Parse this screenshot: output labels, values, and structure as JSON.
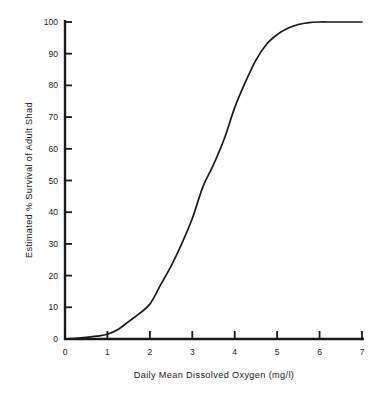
{
  "chart_data": {
    "type": "line",
    "title": "",
    "subtitle": "",
    "xlabel": "Daily Mean Dissolved Oxygen (mg/l)",
    "ylabel": "Estimated % Survival of Adult Shad",
    "xlim": [
      0,
      7
    ],
    "ylim": [
      0,
      100
    ],
    "grid": false,
    "legend": null,
    "xticks": [
      "0",
      "1",
      "2",
      "3",
      "4",
      "5",
      "6",
      "7"
    ],
    "xtick_values": [
      0,
      1,
      2,
      3,
      4,
      5,
      6,
      7
    ],
    "yticks": [
      "0",
      "10",
      "20",
      "30",
      "40",
      "50",
      "60",
      "70",
      "80",
      "90",
      "100"
    ],
    "ytick_values": [
      0,
      10,
      20,
      30,
      40,
      50,
      60,
      70,
      80,
      90,
      100
    ],
    "series": [
      {
        "name": "Estimated % Survival of Adult Shad",
        "color": "#1a1a1a",
        "x": [
          0.0,
          0.25,
          0.5,
          0.75,
          1.0,
          1.25,
          1.5,
          1.75,
          2.0,
          2.25,
          2.5,
          2.75,
          3.0,
          3.25,
          3.5,
          3.75,
          4.0,
          4.25,
          4.5,
          4.75,
          5.0,
          5.25,
          5.5,
          5.75,
          6.0,
          6.25,
          6.5,
          6.75,
          7.0
        ],
        "values": [
          0,
          0.2,
          0.5,
          0.9,
          1.5,
          3.0,
          5.5,
          8.0,
          11.0,
          17.0,
          23.0,
          30.0,
          38.0,
          48.0,
          55.0,
          63.0,
          73.0,
          81.0,
          88.0,
          93.0,
          96.0,
          98.0,
          99.2,
          99.8,
          100,
          100,
          100,
          100,
          100
        ]
      }
    ]
  },
  "axes": {
    "x_axis_name": "Daily Mean Dissolved Oxygen (mg/l)",
    "y_axis_name": "Estimated % Survival of Adult Shad"
  }
}
